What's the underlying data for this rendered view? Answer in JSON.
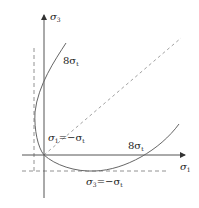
{
  "diagram": {
    "axes": {
      "x_label": "σ",
      "x_label_sub": "1",
      "y_label": "σ",
      "y_label_sub": "3"
    },
    "annotations": {
      "upper_branch": {
        "prefix": "8σ",
        "sub": "t"
      },
      "right_branch": {
        "prefix": "8σ",
        "sub": "t"
      },
      "left_intercept": {
        "text1": "σ",
        "sub1": "1",
        "eq": "=−σ",
        "sub2": "t"
      },
      "bottom_intercept": {
        "text1": "σ",
        "sub1": "3",
        "eq": "=−σ",
        "sub2": "t"
      }
    },
    "colors": {
      "axis": "#555555",
      "curve": "#666666",
      "dashed": "#777777",
      "text": "#222222"
    }
  }
}
